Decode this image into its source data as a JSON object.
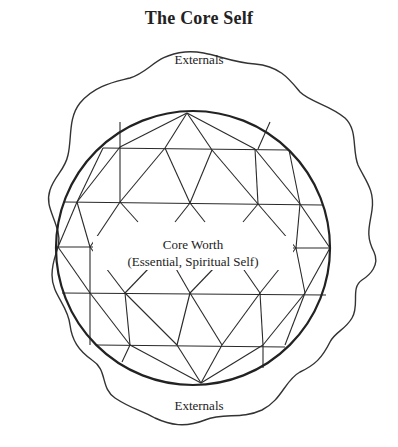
{
  "diagram": {
    "title": "The Core Self",
    "outer_region": {
      "label_top": "Externals",
      "label_bottom": "Externals"
    },
    "inner_sphere": {
      "label_line1": "Core Worth",
      "label_line2": "(Essential, Spiritual Self)"
    }
  }
}
